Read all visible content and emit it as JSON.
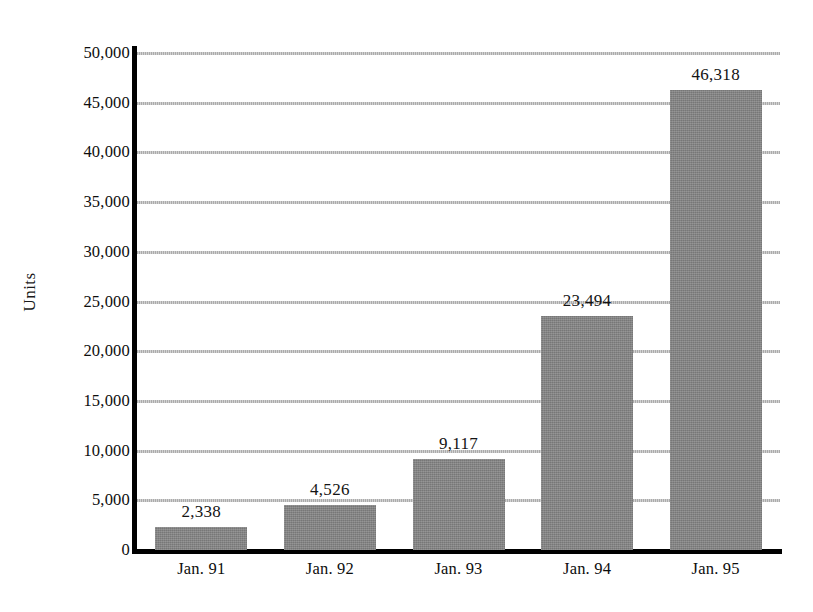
{
  "chart_data": {
    "type": "bar",
    "title": "",
    "subtitle": "",
    "xlabel": "",
    "ylabel": "Units",
    "categories": [
      "Jan. 91",
      "Jan. 92",
      "Jan. 93",
      "Jan. 94",
      "Jan. 95"
    ],
    "values": [
      2338,
      4526,
      9117,
      23494,
      46318
    ],
    "value_labels": [
      "2,338",
      "4,526",
      "9,117",
      "23,494",
      "46,318"
    ],
    "ylim": [
      0,
      50000
    ],
    "ytick_values": [
      0,
      5000,
      10000,
      15000,
      20000,
      25000,
      30000,
      35000,
      40000,
      45000,
      50000
    ],
    "ytick_labels": [
      "0",
      "5,000",
      "10,000",
      "15,000",
      "20,000",
      "25,000",
      "30,000",
      "35,000",
      "40,000",
      "45,000",
      "50,000"
    ],
    "grid": true,
    "grid_axis": "y",
    "legend": false,
    "legend_position": "none",
    "bar_color": "#828282",
    "gridline_color": "#b9b9b9",
    "axis_color": "#000000",
    "background_color": "#ffffff"
  }
}
